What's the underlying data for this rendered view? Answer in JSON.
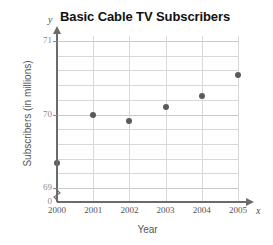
{
  "chart_data": {
    "type": "scatter",
    "title": "Basic Cable TV Subscribers",
    "xlabel": "Year",
    "ylabel": "Subscribers (in millions)",
    "x_axis_letter": "x",
    "y_axis_letter": "y",
    "categories": [
      "2000",
      "2001",
      "2002",
      "2003",
      "2004",
      "2005"
    ],
    "x": [
      2000,
      2001,
      2002,
      2003,
      2004,
      2005
    ],
    "values": [
      69.34,
      70.0,
      69.91,
      70.1,
      70.25,
      70.54
    ],
    "ylim": [
      69,
      71
    ],
    "xlim": [
      2000,
      2005
    ],
    "y_tick_labels": [
      "71",
      "70",
      "69"
    ],
    "y_tick_values": [
      71,
      70,
      69
    ],
    "origin_label": "0",
    "y_minor_step": 0.2,
    "grid": true,
    "legend": null,
    "axis_break": true,
    "marker_color": "#5a5a5a",
    "grid_color": "#d8d8d8",
    "axis_color": "#6b6b6b"
  }
}
